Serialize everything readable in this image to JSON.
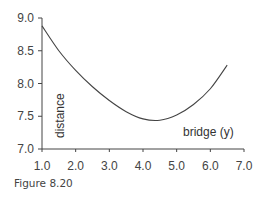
{
  "chart_data": {
    "type": "line",
    "title": "",
    "xlabel": "bridge (y)",
    "ylabel": "distance",
    "xlim": [
      1.0,
      7.0
    ],
    "ylim": [
      7.0,
      9.0
    ],
    "x_ticks": [
      "1.0",
      "2.0",
      "3.0",
      "4.0",
      "5.0",
      "6.0",
      "7.0"
    ],
    "y_ticks": [
      "7.0",
      "7.5",
      "8.0",
      "8.5",
      "9.0"
    ],
    "grid": false,
    "legend": null,
    "series": [
      {
        "name": "distance",
        "x": [
          1.0,
          1.5,
          2.0,
          2.5,
          3.0,
          3.5,
          4.0,
          4.5,
          5.0,
          5.5,
          6.0,
          6.5
        ],
        "values": [
          8.88,
          8.5,
          8.2,
          7.95,
          7.74,
          7.57,
          7.46,
          7.44,
          7.52,
          7.68,
          7.92,
          8.28
        ]
      }
    ],
    "caption": "Figure 8.20"
  }
}
